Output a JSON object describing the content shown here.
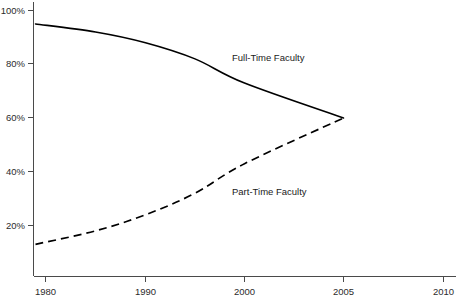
{
  "chart_data": {
    "type": "line",
    "title": "",
    "subtitle": "",
    "xlabel": "",
    "ylabel": "",
    "xlim": [
      1979,
      2010
    ],
    "ylim": [
      0,
      100
    ],
    "grid": false,
    "legend_position": "inline-annotation",
    "x_tick_labels": [
      "1980",
      "1990",
      "2000",
      "2005",
      "2010"
    ],
    "x_tick_values": [
      1980,
      1990,
      2000,
      2005,
      2010
    ],
    "y_tick_labels": [
      "20%",
      "40%",
      "60%",
      "80%",
      "100%"
    ],
    "y_tick_values": [
      20,
      40,
      60,
      80,
      100
    ],
    "annotations": [
      {
        "text": "Full-Time Faculty",
        "x": 1996,
        "y": 81
      },
      {
        "text": "Part-Time Faculty",
        "x": 1996,
        "y": 36
      }
    ],
    "series": [
      {
        "name": "Full-Time Faculty",
        "style": "solid",
        "color": "#000000",
        "x": [
          1979,
          1985,
          1990,
          1995,
          2000,
          2005
        ],
        "values": [
          95,
          92,
          88,
          82,
          73,
          60
        ]
      },
      {
        "name": "Part-Time Faculty",
        "style": "dashed",
        "color": "#000000",
        "x": [
          1979,
          1985,
          1990,
          1995,
          2000,
          2005
        ],
        "values": [
          13,
          18,
          24,
          32,
          43,
          60
        ]
      }
    ]
  },
  "axes": {
    "y_ticks": [
      {
        "label": "100%"
      },
      {
        "label": "80%"
      },
      {
        "label": "60%"
      },
      {
        "label": "40%"
      },
      {
        "label": "20%"
      }
    ],
    "x_ticks": [
      {
        "label": "1980"
      },
      {
        "label": "1990"
      },
      {
        "label": "2000"
      },
      {
        "label": "2005"
      },
      {
        "label": "2010"
      }
    ]
  },
  "series_labels": {
    "full_time": "Full-Time Faculty",
    "part_time": "Part-Time Faculty"
  }
}
